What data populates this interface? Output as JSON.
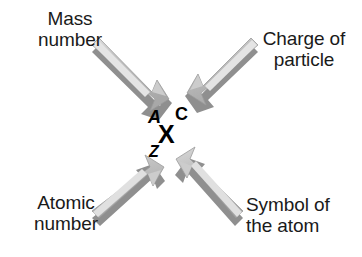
{
  "diagram": {
    "background_color": "#ffffff",
    "text_color": "#1a1a1a",
    "arrow_colors": {
      "body": "#b3b3b3",
      "highlight": "#d9d9d9",
      "shadow": "#8c8c8c",
      "edge": "#9e9e9e"
    }
  },
  "nuclide": {
    "mass_number": "A",
    "charge": "C",
    "symbol": "X",
    "atomic_number": "Z"
  },
  "labels": {
    "mass_number": {
      "line1": "Mass",
      "line2": "number"
    },
    "charge_of_particle": {
      "line1": "Charge of",
      "line2": "particle"
    },
    "atomic_number": {
      "line1": "Atomic",
      "line2": "number"
    },
    "symbol_of_atom": {
      "line1": "Symbol of",
      "line2": "the atom"
    }
  },
  "arrows": [
    {
      "name": "arrow-mass-number",
      "from": "top-left",
      "points_to": "A"
    },
    {
      "name": "arrow-charge",
      "from": "top-right",
      "points_to": "C"
    },
    {
      "name": "arrow-atomic-number",
      "from": "bottom-left",
      "points_to": "Z"
    },
    {
      "name": "arrow-symbol",
      "from": "bottom-right",
      "points_to": "X"
    }
  ]
}
